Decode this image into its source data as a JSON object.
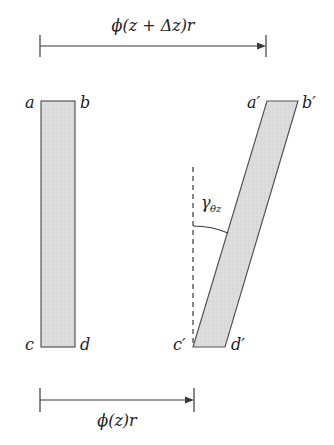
{
  "diagram": {
    "colors": {
      "stroke": "#3a3a3a",
      "fill": "#dcdcdc",
      "text": "#222222",
      "background": "#ffffff"
    },
    "top_dimension": {
      "label": "ϕ(z + Δz)r",
      "x_start": 40,
      "x_end": 266,
      "y": 46
    },
    "bottom_dimension": {
      "label": "ϕ(z)r",
      "x_start": 40,
      "x_end": 194,
      "y": 400
    },
    "original_element": {
      "corners": {
        "a": "a",
        "b": "b",
        "c": "c",
        "d": "d"
      },
      "rect": {
        "x": 41,
        "y": 101,
        "width": 34,
        "height": 246
      }
    },
    "deformed_element": {
      "corners": {
        "a": "a′",
        "b": "b′",
        "c": "c′",
        "d": "d′"
      },
      "points": {
        "a": [
          267,
          101
        ],
        "b": [
          298,
          101
        ],
        "d": [
          225,
          347
        ],
        "c": [
          193,
          347
        ]
      }
    },
    "reference_line": {
      "style": "dashed",
      "x": 193,
      "y_start": 167,
      "y_end": 347
    },
    "angle": {
      "symbol": "γ",
      "subscript": "θz",
      "label": "γθz"
    }
  }
}
